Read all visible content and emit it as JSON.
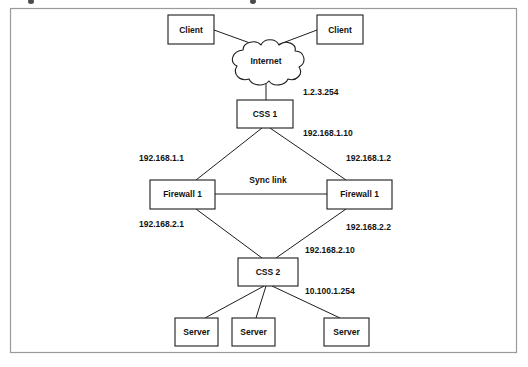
{
  "figure": {
    "kind": "network-topology-diagram",
    "frame": {
      "x": 10,
      "y": 8,
      "width": 506,
      "height": 344
    }
  },
  "nodes": {
    "client_left": {
      "label": "Client",
      "x": 168,
      "y": 15,
      "w": 46,
      "h": 29
    },
    "client_right": {
      "label": "Client",
      "x": 317,
      "y": 15,
      "w": 46,
      "h": 29
    },
    "internet": {
      "label": "Internet",
      "cx": 266,
      "cy": 62
    },
    "css1": {
      "label": "CSS 1",
      "x": 237,
      "y": 100,
      "w": 56,
      "h": 28
    },
    "firewall_left": {
      "label": "Firewall 1",
      "x": 150,
      "y": 180,
      "w": 65,
      "h": 29
    },
    "firewall_right": {
      "label": "Firewall 1",
      "x": 327,
      "y": 180,
      "w": 65,
      "h": 29
    },
    "css2": {
      "label": "CSS 2",
      "x": 238,
      "y": 258,
      "w": 60,
      "h": 28
    },
    "server_1": {
      "label": "Server",
      "x": 175,
      "y": 318,
      "w": 43,
      "h": 28
    },
    "server_2": {
      "label": "Server",
      "x": 232,
      "y": 318,
      "w": 43,
      "h": 28
    },
    "server_3": {
      "label": "Server",
      "x": 324,
      "y": 318,
      "w": 45,
      "h": 28
    }
  },
  "edge_labels": {
    "sync_link": {
      "text": "Sync link",
      "x": 268,
      "y": 181
    }
  },
  "ip_labels": {
    "css1_outside": {
      "text": "1.2.3.254",
      "x": 303,
      "y": 93,
      "anchor": "start"
    },
    "css1_inside": {
      "text": "192.168.1.10",
      "x": 303,
      "y": 134,
      "anchor": "start"
    },
    "firewall_left_upper": {
      "text": "192.168.1.1",
      "x": 139,
      "y": 159,
      "anchor": "start"
    },
    "firewall_right_upper": {
      "text": "192.168.1.2",
      "x": 346,
      "y": 159,
      "anchor": "start"
    },
    "firewall_left_lower": {
      "text": "192.168.2.1",
      "x": 139,
      "y": 225,
      "anchor": "start"
    },
    "firewall_right_lower": {
      "text": "192.168.2.2",
      "x": 346,
      "y": 228,
      "anchor": "start"
    },
    "css2_upper": {
      "text": "192.168.2.10",
      "x": 305,
      "y": 251,
      "anchor": "start"
    },
    "css2_lower": {
      "text": "10.100.1.254",
      "x": 305,
      "y": 292,
      "anchor": "start"
    }
  },
  "links": [
    {
      "name": "client-left-to-internet",
      "d": "M 214 30 L 261 47"
    },
    {
      "name": "client-right-to-internet",
      "d": "M 317 30 L 272 47"
    },
    {
      "name": "internet-to-css1",
      "d": "M 266 78 L 266 100"
    },
    {
      "name": "css1-to-firewall-left",
      "d": "M 262 128 L 196 180"
    },
    {
      "name": "css1-to-firewall-right",
      "d": "M 270 128 L 346 180"
    },
    {
      "name": "firewall-left-to-firewall-right",
      "d": "M 215 194 L 327 194"
    },
    {
      "name": "firewall-left-to-css2",
      "d": "M 196 209 L 262 258"
    },
    {
      "name": "firewall-right-to-css2",
      "d": "M 346 209 L 276 258"
    },
    {
      "name": "css2-to-server-1",
      "d": "M 264 286 L 205 318"
    },
    {
      "name": "css2-to-server-2",
      "d": "M 266 286 L 256 318"
    },
    {
      "name": "css2-to-server-3",
      "d": "M 272 286 L 340 318"
    }
  ]
}
